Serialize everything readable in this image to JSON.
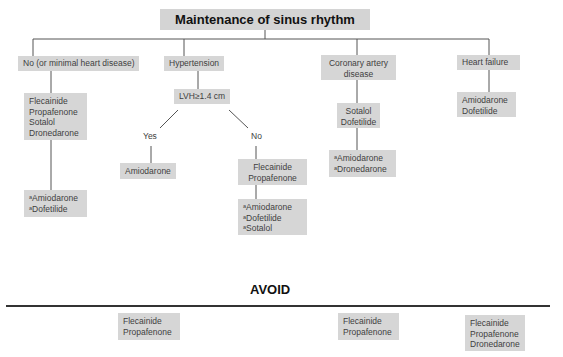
{
  "title": "Maintenance of sinus rhythm",
  "categories": {
    "no_heart_disease": {
      "label": "No (or minimal heart disease)",
      "first_line": [
        "Flecainide",
        "Propafenone",
        "Sotalol",
        "Dronedarone"
      ],
      "second_line": [
        "Amiodarone",
        "Dofetilide"
      ]
    },
    "hypertension": {
      "label": "Hypertension",
      "decision": "LVH≥1.4 cm",
      "yes_label": "Yes",
      "no_label": "No",
      "yes_drugs": [
        "Amiodarone"
      ],
      "no_first_line": [
        "Flecainide",
        "Propafenone"
      ],
      "no_second_line": [
        "Amiodarone",
        "Dofetilide",
        "Sotalol"
      ]
    },
    "cad": {
      "label_line1": "Coronary artery",
      "label_line2": "disease",
      "first_line": [
        "Sotalol",
        "Dofetilide"
      ],
      "second_line": [
        "Amiodarone",
        "Dronedarone"
      ]
    },
    "heart_failure": {
      "label": "Heart failure",
      "first_line": [
        "Amiodarone",
        "Dofetilide"
      ]
    }
  },
  "footnote_marker": "a",
  "avoid": {
    "heading": "AVOID",
    "hypertension_lvh": [
      "Flecainide",
      "Propafenone"
    ],
    "cad": [
      "Flecainide",
      "Propafenone"
    ],
    "heart_failure": [
      "Flecainide",
      "Propafenone",
      "Dronedarone"
    ]
  }
}
